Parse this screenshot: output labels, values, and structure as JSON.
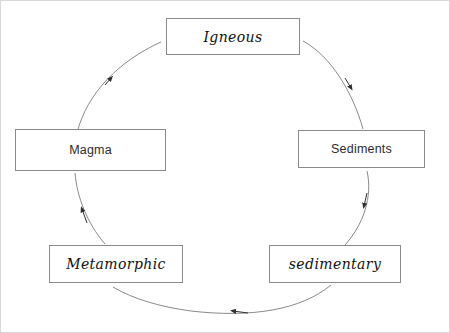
{
  "diagram": {
    "background_color": "#ffffff",
    "stroke_color": "#8a8a8a",
    "arrow_color": "#3a3a3a",
    "nodes": [
      {
        "id": "igneous",
        "label": "Igneous",
        "style": "script",
        "position": "top"
      },
      {
        "id": "sediments",
        "label": "Sediments",
        "style": "plain",
        "position": "right"
      },
      {
        "id": "sedimentary",
        "label": "sedimentary",
        "style": "script",
        "position": "bottom-right"
      },
      {
        "id": "metamorphic",
        "label": "Metamorphic",
        "style": "script",
        "position": "bottom-left"
      },
      {
        "id": "magma",
        "label": "Magma",
        "style": "plain",
        "position": "left"
      }
    ],
    "arrows": [
      {
        "from": "magma",
        "to": "igneous",
        "direction": "up-right",
        "marker": "solid-triangle"
      },
      {
        "from": "igneous",
        "to": "sediments",
        "direction": "down-right",
        "marker": "solid-triangle"
      },
      {
        "from": "sediments",
        "to": "sedimentary",
        "direction": "down-left",
        "marker": "solid-triangle"
      },
      {
        "from": "sedimentary",
        "to": "metamorphic",
        "direction": "left",
        "marker": "solid-triangle"
      },
      {
        "from": "metamorphic",
        "to": "magma",
        "direction": "up-left",
        "marker": "solid-triangle"
      }
    ],
    "cycle_order": "Magma to Igneous to Sediments to sedimentary to Metamorphic to Magma",
    "path_shape": "ellipse"
  }
}
